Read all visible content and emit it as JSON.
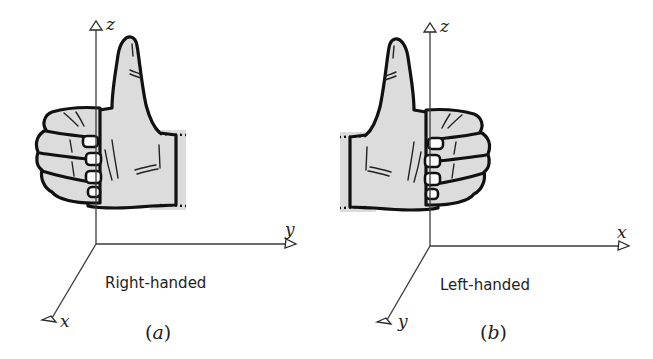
{
  "figure": {
    "panels": [
      {
        "id": "a",
        "subcaption_open": "(",
        "subcaption_letter": "a",
        "subcaption_close": ")",
        "caption": "Right-handed",
        "hand": "right",
        "axes": {
          "up": "z",
          "right": "y",
          "diagonal": "x"
        }
      },
      {
        "id": "b",
        "subcaption_open": "(",
        "subcaption_letter": "b",
        "subcaption_close": ")",
        "caption": "Left-handed",
        "hand": "left",
        "axes": {
          "up": "z",
          "right": "x",
          "diagonal": "y"
        }
      }
    ],
    "colors": {
      "skin_fill": "#dcdcdc",
      "ink": "#111111",
      "axis": "#3a3a3a",
      "background": "#ffffff"
    }
  }
}
